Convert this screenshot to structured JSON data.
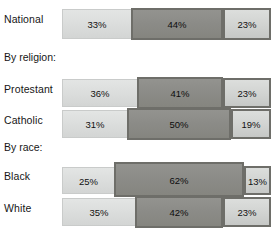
{
  "chart_data": {
    "type": "bar",
    "subtype": "stacked-horizontal-100pct",
    "title": "",
    "xlabel": "",
    "ylabel": "",
    "xlim": [
      0,
      100
    ],
    "grid": false,
    "legend": null,
    "value_suffix": "%",
    "categories": [
      "National",
      "Protestant",
      "Catholic",
      "Black",
      "White"
    ],
    "group_headers": [
      "By religion:",
      "By race:"
    ],
    "series": [
      {
        "name": "segment-1",
        "values": [
          33,
          36,
          31,
          25,
          35
        ]
      },
      {
        "name": "segment-2",
        "values": [
          44,
          41,
          50,
          62,
          42
        ]
      },
      {
        "name": "segment-3",
        "values": [
          23,
          23,
          19,
          13,
          23
        ]
      }
    ],
    "colors": {
      "segment_1": "#dcdedd",
      "segment_2": "#8b8b87",
      "segment_3": "#d2d4d2",
      "segment_2_border": "#6e6e69",
      "segment_3_border": "#6e6e69",
      "background": "#ffffff",
      "text": "#161616"
    }
  },
  "rows": [
    {
      "id": "national",
      "label": "National",
      "segments": [
        {
          "name": "seg-1",
          "value": 33,
          "text": "33%"
        },
        {
          "name": "seg-2",
          "value": 44,
          "text": "44%"
        },
        {
          "name": "seg-3",
          "value": 23,
          "text": "23%"
        }
      ]
    },
    {
      "id": "protestant",
      "label": "Protestant",
      "segments": [
        {
          "name": "seg-1",
          "value": 36,
          "text": "36%"
        },
        {
          "name": "seg-2",
          "value": 41,
          "text": "41%"
        },
        {
          "name": "seg-3",
          "value": 23,
          "text": "23%"
        }
      ]
    },
    {
      "id": "catholic",
      "label": "Catholic",
      "segments": [
        {
          "name": "seg-1",
          "value": 31,
          "text": "31%"
        },
        {
          "name": "seg-2",
          "value": 50,
          "text": "50%"
        },
        {
          "name": "seg-3",
          "value": 19,
          "text": "19%"
        }
      ]
    },
    {
      "id": "black",
      "label": "Black",
      "segments": [
        {
          "name": "seg-1",
          "value": 25,
          "text": "25%"
        },
        {
          "name": "seg-2",
          "value": 62,
          "text": "62%"
        },
        {
          "name": "seg-3",
          "value": 13,
          "text": "13%"
        }
      ]
    },
    {
      "id": "white",
      "label": "White",
      "segments": [
        {
          "name": "seg-1",
          "value": 35,
          "text": "35%"
        },
        {
          "name": "seg-2",
          "value": 42,
          "text": "42%"
        },
        {
          "name": "seg-3",
          "value": 23,
          "text": "23%"
        }
      ]
    }
  ],
  "headers": [
    {
      "id": "by-religion",
      "label": "By religion:"
    },
    {
      "id": "by-race",
      "label": "By race:"
    }
  ]
}
